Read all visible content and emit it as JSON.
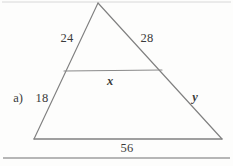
{
  "figure": {
    "part_label": "a)",
    "labels": {
      "left_upper_side": "24",
      "right_upper_side": "28",
      "midsegment": "x",
      "left_lower_side": "18",
      "right_lower_side": "y",
      "base": "56"
    },
    "colors": {
      "stroke": "#808080",
      "text": "#3a3a3a",
      "rule": "#707070",
      "background": "#fdfdfc"
    },
    "geometry": {
      "apex": [
        98,
        3
      ],
      "bottom_left": [
        34,
        139
      ],
      "bottom_right": [
        222,
        139
      ],
      "midsegment_left": [
        64,
        71
      ],
      "midsegment_right": [
        162,
        70
      ],
      "bottom_rule_y": 158,
      "top_rule_y": 2
    }
  }
}
